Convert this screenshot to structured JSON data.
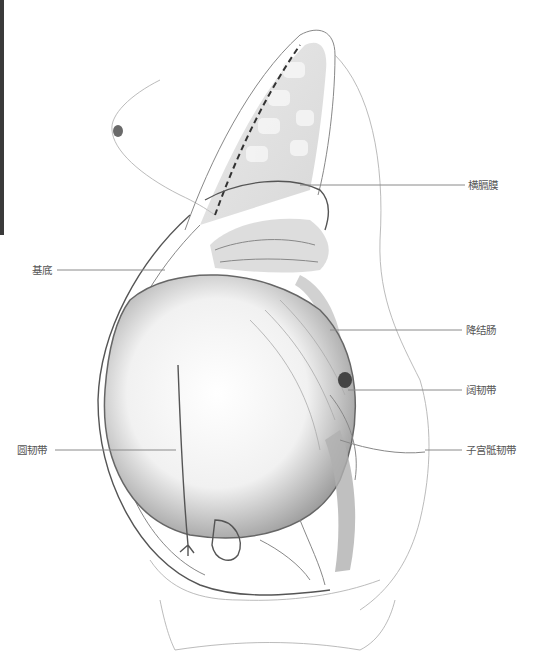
{
  "figure": {
    "labels": {
      "diaphragm": "横膈膜",
      "fundus": "基底",
      "descending_colon": "降结肠",
      "broad_ligament": "阔韧带",
      "uterosacral_ligament": "子宫骶韧带",
      "round_ligament": "圆韧带"
    }
  }
}
